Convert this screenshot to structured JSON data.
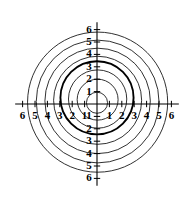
{
  "chart_data": {
    "type": "line",
    "title": "",
    "subtitle": "",
    "xlabel": "",
    "ylabel": "",
    "grid": false,
    "legend": null,
    "legend_position": "none",
    "xlim": [
      -6.6,
      6.6
    ],
    "ylim": [
      -6.6,
      6.6
    ],
    "x_ticks": [
      -6,
      -5,
      -4,
      -3,
      -2,
      -1,
      1,
      2,
      3,
      4,
      5,
      6
    ],
    "y_ticks": [
      -6,
      -5,
      -4,
      -3,
      -2,
      -1,
      1,
      2,
      3,
      4,
      5,
      6
    ],
    "x_tick_labels": [
      "6",
      "5",
      "4",
      "3",
      "2",
      "1",
      "1",
      "2",
      "3",
      "4",
      "5",
      "6"
    ],
    "y_tick_labels": [
      "6",
      "5",
      "4",
      "3",
      "2",
      "1",
      "1",
      "2",
      "3",
      "4",
      "5",
      "6"
    ],
    "axis_color": "#000000",
    "curve_color": "#1a1a1a",
    "highlight_color": "#000000",
    "series": [
      {
        "name": "circle-1",
        "shape": "circle",
        "cx": 0.0,
        "cy": 0.1,
        "r": 0.85,
        "emphasis": false
      },
      {
        "name": "circle-2",
        "shape": "circle",
        "cx": 0.05,
        "cy": 0.35,
        "r": 1.65,
        "emphasis": false
      },
      {
        "name": "circle-3",
        "shape": "circle",
        "cx": 0.05,
        "cy": 0.4,
        "r": 2.35,
        "emphasis": false
      },
      {
        "name": "circle-4",
        "shape": "circle",
        "cx": 0.0,
        "cy": 0.5,
        "r": 2.95,
        "emphasis": true
      },
      {
        "name": "circle-5",
        "shape": "circle",
        "cx": 0.05,
        "cy": 0.3,
        "r": 3.55,
        "emphasis": false
      },
      {
        "name": "circle-6",
        "shape": "circle",
        "cx": 0.05,
        "cy": 0.25,
        "r": 4.25,
        "emphasis": false
      },
      {
        "name": "circle-7",
        "shape": "circle",
        "cx": 0.05,
        "cy": 0.2,
        "r": 4.95,
        "emphasis": false
      },
      {
        "name": "circle-8",
        "shape": "circle",
        "cx": 0.05,
        "cy": 0.15,
        "r": 5.65,
        "emphasis": false
      }
    ]
  }
}
